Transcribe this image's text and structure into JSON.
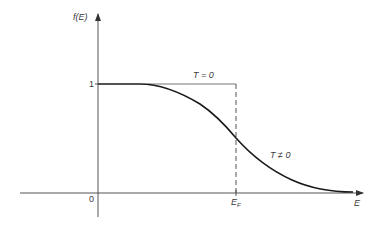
{
  "diagram": {
    "y_axis": {
      "label": "f(E)",
      "tick_label": "1"
    },
    "x_axis": {
      "label": "E",
      "origin_label": "0",
      "fermi_label_main": "E",
      "fermi_label_sub": "F"
    },
    "curves": [
      {
        "name": "T = 0",
        "label": "T = 0",
        "style": "step, thin solid top + dashed vertical at E_F"
      },
      {
        "name": "T ≠ 0",
        "label": "T ≠ 0",
        "style": "smooth solid curve"
      }
    ],
    "colors": {
      "axis": "#555555",
      "curve": "#1a1a1a",
      "step": "#666666",
      "text": "#3a3a3a"
    }
  }
}
